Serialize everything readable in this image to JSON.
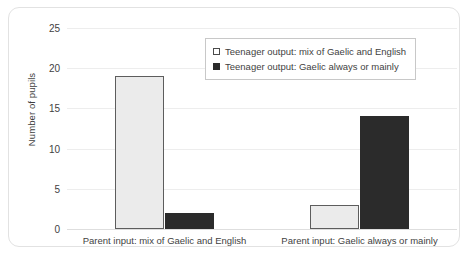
{
  "chart_data": {
    "type": "bar",
    "title": "",
    "xlabel": "",
    "ylabel": "Number of pupils",
    "ylim": [
      0,
      25
    ],
    "ytick_values": [
      0,
      5,
      10,
      15,
      20,
      25
    ],
    "ytick_labels": [
      "0",
      "5",
      "10",
      "15",
      "20",
      "25"
    ],
    "grid": true,
    "legend_position": "upper center",
    "categories": [
      "Parent input: mix of Gaelic and English",
      "Parent input: Gaelic always or mainly"
    ],
    "series": [
      {
        "name": "Teenager output: mix of Gaelic and English",
        "values": [
          19,
          3
        ],
        "color": "#ebebeb",
        "edge_color": "#5d5d5d",
        "swatch": "light"
      },
      {
        "name": "Teenager output: Gaelic always or mainly",
        "values": [
          2,
          14
        ],
        "color": "#2b2b2b",
        "edge_color": "#2b2b2b",
        "swatch": "dark"
      }
    ]
  },
  "colors": {
    "frame_border": "#e2e2e2",
    "gridline": "#ededed",
    "baseline": "#dedede",
    "text": "#3f3f3f",
    "series_light": "#ebebeb",
    "series_dark": "#2b2b2b"
  }
}
